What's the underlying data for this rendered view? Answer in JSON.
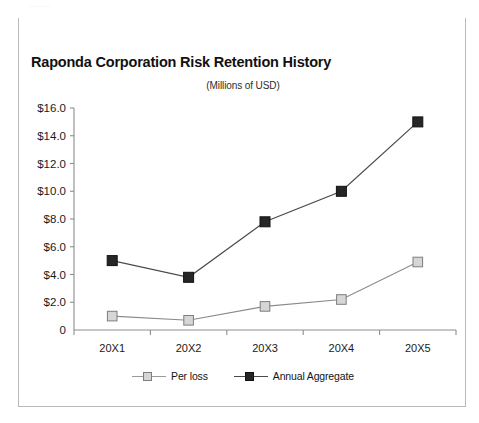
{
  "scan_artifact_text": "........",
  "card": {
    "title": "Raponda Corporation Risk Retention History",
    "subtitle": "(Millions of USD)",
    "header_bar_color": "#2b2b2b",
    "border_color": "#b9b9b9",
    "background_color": "#ffffff"
  },
  "legend": {
    "entries": [
      {
        "label": "Per loss",
        "marker": "open-square-marker",
        "color": "#d6d6d6",
        "line_color": "#9a9a9a"
      },
      {
        "label": "Annual Aggregate",
        "marker": "filled-square-marker",
        "color": "#262626",
        "line_color": "#4a4a4a"
      }
    ]
  },
  "chart_data": {
    "type": "line",
    "title": "Raponda Corporation Risk Retention History",
    "subtitle": "(Millions of USD)",
    "xlabel": "",
    "ylabel": "",
    "categories": [
      "20X1",
      "20X2",
      "20X3",
      "20X4",
      "20X5"
    ],
    "ylim": [
      0,
      16
    ],
    "ytick_values": [
      0,
      2,
      4,
      6,
      8,
      10,
      12,
      14,
      16
    ],
    "ytick_labels": [
      "0",
      "$2.0",
      "$4.0",
      "$6.0",
      "$8.0",
      "$10.0",
      "$12.0",
      "$14.0",
      "$16.0"
    ],
    "grid": false,
    "legend_position": "bottom",
    "series": [
      {
        "name": "Per loss",
        "values": [
          1.0,
          0.7,
          1.7,
          2.2,
          4.9
        ],
        "color": "#d6d6d6",
        "line_color": "#9a9a9a",
        "marker": "open-square-marker"
      },
      {
        "name": "Annual Aggregate",
        "values": [
          5.0,
          3.8,
          7.8,
          10.0,
          15.0
        ],
        "color": "#262626",
        "line_color": "#4a4a4a",
        "marker": "filled-square-marker"
      }
    ]
  }
}
